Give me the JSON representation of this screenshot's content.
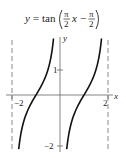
{
  "figure": {
    "equation": {
      "lhs": "y",
      "equals": "=",
      "func": "tan",
      "frac1_num": "π",
      "frac1_den": "2",
      "var": "x",
      "minus": "−",
      "frac2_num": "π",
      "frac2_den": "2",
      "text": "y = tan(π/2 x − π/2)"
    },
    "axes": {
      "x_label": "x",
      "y_label": "y",
      "x_ticks": [
        {
          "value": -2,
          "label": "−2"
        },
        {
          "value": 2,
          "label": "2"
        }
      ],
      "y_ticks": [
        {
          "value": 1,
          "label": "1"
        },
        {
          "value": -2,
          "label": "−2"
        }
      ]
    },
    "asymptotes": [
      -2,
      2
    ],
    "colors": {
      "curve": "#111111",
      "axis": "#666666",
      "asymptote": "#888888",
      "text": "#222222"
    }
  },
  "chart_data": {
    "type": "line",
    "xlabel": "x",
    "ylabel": "y",
    "xlim": [
      -2,
      2
    ],
    "ylim": [
      -2.2,
      2.3
    ],
    "x_ticks": [
      -2,
      2
    ],
    "y_ticks": [
      1,
      -2
    ],
    "asymptotes_x": [
      -2,
      2
    ],
    "grid": false,
    "series": [
      {
        "name": "branch 1",
        "x": [
          -1.75,
          -1.5,
          -1.25,
          -1.0,
          -0.75,
          -0.5,
          -0.3
        ],
        "y": [
          -2.41,
          -1.0,
          -0.41,
          0.0,
          0.41,
          1.0,
          1.96
        ]
      },
      {
        "name": "branch 2",
        "x": [
          0.25,
          0.5,
          0.75,
          1.0,
          1.25,
          1.5,
          1.7
        ],
        "y": [
          -2.41,
          -1.0,
          -0.41,
          0.0,
          0.41,
          1.0,
          1.96
        ]
      }
    ]
  }
}
